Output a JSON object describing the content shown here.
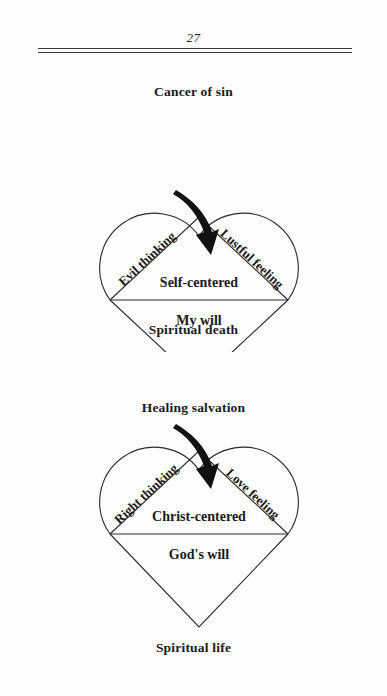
{
  "page": {
    "folio": "27",
    "rule_count": 2
  },
  "diagrams": [
    {
      "id": "sin",
      "caption_top": "Cancer of sin",
      "caption_bottom": "Spiritual death",
      "left_lobe_label": "Evil thinking",
      "right_lobe_label": "Lustful feeling",
      "center_label": "Self-centered",
      "will_label": "My will",
      "arrow": "curved-arrow-down-right"
    },
    {
      "id": "salvation",
      "caption_top": "Healing salvation",
      "caption_bottom": "Spiritual life",
      "left_lobe_label": "Right thinking",
      "right_lobe_label": "Love feeling",
      "center_label": "Christ-centered",
      "will_label": "God's will",
      "arrow": "curved-arrow-down-right"
    }
  ],
  "colors": {
    "ink": "#1a1a1a",
    "stroke": "#2a2a2a",
    "paper": "#fdfdfc"
  }
}
